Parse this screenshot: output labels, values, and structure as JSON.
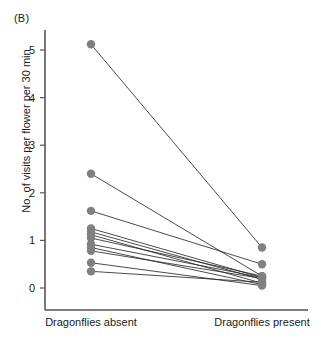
{
  "panel": {
    "label": "(B)"
  },
  "axes": {
    "y_title": "No. of visits per flower per 30 min",
    "y_ticks": [
      "0",
      "1",
      "2",
      "3",
      "4",
      "5"
    ],
    "x_categories": [
      "Dragonflies absent",
      "Dragonflies present"
    ]
  },
  "colors": {
    "marker": "#808080",
    "line": "#2b2b2b",
    "axis": "#555555",
    "background": "#ffffff"
  },
  "chart_data": {
    "type": "line",
    "title": "(B)",
    "subtitle": "",
    "xlabel": "",
    "ylabel": "No. of visits per flower per 30 min",
    "categories": [
      "Dragonflies absent",
      "Dragonflies present"
    ],
    "xlim": [
      0,
      1
    ],
    "ylim": [
      0,
      5.4
    ],
    "ytick_values": [
      0,
      1,
      2,
      3,
      4,
      5
    ],
    "grid": false,
    "legend": "none",
    "annotations": [
      "(B)"
    ],
    "paired_design": true,
    "series": [
      {
        "name": "pair-1",
        "values": [
          5.12,
          0.85
        ]
      },
      {
        "name": "pair-2",
        "values": [
          2.4,
          0.25
        ]
      },
      {
        "name": "pair-3",
        "values": [
          1.62,
          0.5
        ]
      },
      {
        "name": "pair-4",
        "values": [
          1.25,
          0.22
        ]
      },
      {
        "name": "pair-5",
        "values": [
          1.18,
          0.18
        ]
      },
      {
        "name": "pair-6",
        "values": [
          1.12,
          0.1
        ]
      },
      {
        "name": "pair-7",
        "values": [
          0.92,
          0.22
        ]
      },
      {
        "name": "pair-8",
        "values": [
          0.85,
          0.07
        ]
      },
      {
        "name": "pair-9",
        "values": [
          0.78,
          0.2
        ]
      },
      {
        "name": "pair-10",
        "values": [
          0.53,
          0.05
        ]
      },
      {
        "name": "pair-11",
        "values": [
          0.35,
          0.12
        ]
      },
      {
        "name": "pair-12",
        "values": [
          1.05,
          0.25
        ]
      }
    ]
  }
}
